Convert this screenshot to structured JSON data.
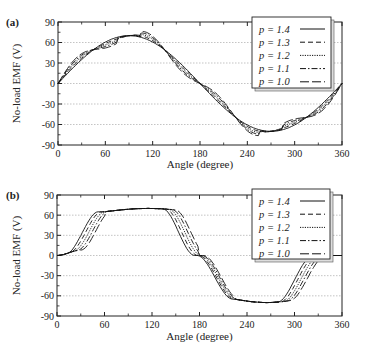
{
  "chart_data": [
    {
      "panel_label": "(a)",
      "type": "line",
      "title": "",
      "xlabel": "Angle (degree)",
      "ylabel": "No-load EMF (V)",
      "xlim": [
        0,
        360
      ],
      "ylim": [
        -90,
        90
      ],
      "xticks": [
        0,
        60,
        120,
        180,
        240,
        300,
        360
      ],
      "yticks": [
        90,
        60,
        30,
        0,
        -30,
        -60,
        -90
      ],
      "grid": "horizontal dotted",
      "legend_position": "upper right",
      "amplitude": 70,
      "series": [
        {
          "name": "p = 1.4",
          "style": "solid",
          "ripple": 0
        },
        {
          "name": "p = 1.3",
          "style": "dashed",
          "ripple": 2.5
        },
        {
          "name": "p = 1.2",
          "style": "dotted",
          "ripple": 5
        },
        {
          "name": "p = 1.1",
          "style": "dash-dot",
          "ripple": 7.5
        },
        {
          "name": "p = 1.0",
          "style": "long-dash",
          "ripple": 10
        }
      ],
      "description": "Near-sinusoidal EMF, peak about 70 V at 90 deg, minimum about -70 V at 270 deg; curves braid with ripple crossings near 35, 145, 215, 325 deg"
    },
    {
      "panel_label": "(b)",
      "type": "line",
      "title": "",
      "xlabel": "Angle (degree)",
      "ylabel": "No-load EMF (V)",
      "xlim": [
        0,
        360
      ],
      "ylim": [
        -90,
        90
      ],
      "xticks": [
        0,
        60,
        120,
        180,
        240,
        300,
        360
      ],
      "yticks": [
        90,
        60,
        30,
        0,
        -30,
        -60,
        -90
      ],
      "grid": "horizontal dotted",
      "legend_position": "upper right",
      "amplitude": 70,
      "series": [
        {
          "name": "p = 1.4",
          "style": "solid",
          "shift": -16
        },
        {
          "name": "p = 1.3",
          "style": "dashed",
          "shift": -12
        },
        {
          "name": "p = 1.2",
          "style": "dotted",
          "shift": -8
        },
        {
          "name": "p = 1.1",
          "style": "dash-dot",
          "shift": -4
        },
        {
          "name": "p = 1.0",
          "style": "long-dash",
          "shift": 0
        }
      ],
      "description": "Trapezoid-like EMF, flat top about 65-70 V between ~60 and ~160 deg, crossing 0 near 183 deg, bottom about -70 V between ~230 and ~300 deg; steep edges shift right as p decreases"
    }
  ]
}
